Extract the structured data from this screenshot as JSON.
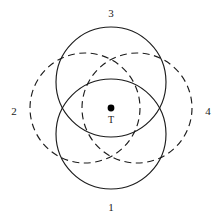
{
  "figure": {
    "background_color": "#ffffff",
    "stroke_color": "#1c1c1c",
    "width": 222,
    "height": 224,
    "center_point": {
      "label": "T",
      "x": 111,
      "y": 108,
      "dot_radius": 3.4,
      "dot_color": "#000000",
      "label_x": 111,
      "label_y": 121
    },
    "circles": [
      {
        "id": "circle-1",
        "label": "1",
        "position": "bottom",
        "style": "solid",
        "cx": 111,
        "cy": 134,
        "r": 55,
        "label_x": 111,
        "label_y": 208
      },
      {
        "id": "circle-2",
        "label": "2",
        "position": "left",
        "style": "dashed",
        "cx": 85,
        "cy": 108,
        "r": 55,
        "label_x": 14,
        "label_y": 112
      },
      {
        "id": "circle-3",
        "label": "3",
        "position": "top",
        "style": "solid",
        "cx": 111,
        "cy": 82,
        "r": 55,
        "label_x": 111,
        "label_y": 14
      },
      {
        "id": "circle-4",
        "label": "4",
        "position": "right",
        "style": "dashed",
        "cx": 137,
        "cy": 108,
        "r": 55,
        "label_x": 208,
        "label_y": 112
      }
    ]
  }
}
